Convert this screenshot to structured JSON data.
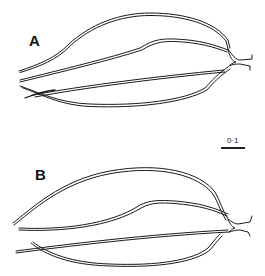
{
  "figure": {
    "panels": [
      {
        "label": "A"
      },
      {
        "label": "B"
      }
    ],
    "scale_bar": {
      "label": "0·1"
    }
  },
  "colors": {
    "line": "#1a1a1a",
    "background": "#ffffff"
  }
}
